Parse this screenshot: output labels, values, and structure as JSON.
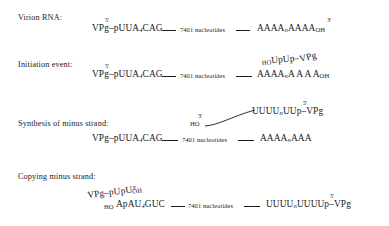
{
  "diagram": {
    "linker_text": "7401 nucleotides",
    "ink_color": "#1a1a1a",
    "background_color": "#ffffff"
  },
  "stages": [
    {
      "id": "virion-rna",
      "label": "Virion RNA:",
      "five_prime": "5'",
      "three_prime": "3'",
      "left_seq": "VPg–pUUA",
      "left_seq_sub": "4",
      "left_seq_tail": "CAG",
      "linker": "7401 nucleotides",
      "right_seq": "AAAA",
      "right_seq_sub": "n",
      "right_seq_mid": "AAAA",
      "right_seq_sub2": "OH"
    },
    {
      "id": "initiation-event",
      "label": "Initiation event:",
      "five_prime": "5'",
      "left_seq": "VPg–pUUA",
      "left_seq_sub": "4",
      "left_seq_tail": "CAG",
      "linker": "7401 nucleotides",
      "right_seq": "AAAA",
      "right_seq_sub": "n",
      "right_seq_mid": "A A  A A",
      "right_seq_sub2": "OH",
      "primer_sub": "HO",
      "primer_seq": "UpUp–",
      "primer_vpg": "VPg"
    },
    {
      "id": "synthesis-minus-strand",
      "label": "Synthesis of minus strand:",
      "three_prime": "3'",
      "five_prime": "5'",
      "ho_label": "HO",
      "minus_seq": "UUUU",
      "minus_seq_sub": "n",
      "minus_seq_tail": "UUp–VPg",
      "left_seq": "VPg–pUUA",
      "left_seq_sub": "4",
      "left_seq_tail": "CAG",
      "linker": "7401 nucleotides",
      "right_seq": "AAAA",
      "right_seq_sub": "n",
      "right_seq_mid": "AAA"
    },
    {
      "id": "copying-minus-strand",
      "label": "Copying minus strand:",
      "three_prime": "3'",
      "five_prime": "5'",
      "top_seq": "VPg–pUpU",
      "top_seq_sub": "OH",
      "ho_label": "HO",
      "bottom_seq": "ApAU",
      "bottom_seq_sub": "4",
      "bottom_seq_tail": "GUC",
      "linker": "7401 nucleotides",
      "right_seq": "UUUU",
      "right_seq_sub": "n",
      "right_seq_mid": "UUUUp–VPg"
    }
  ]
}
